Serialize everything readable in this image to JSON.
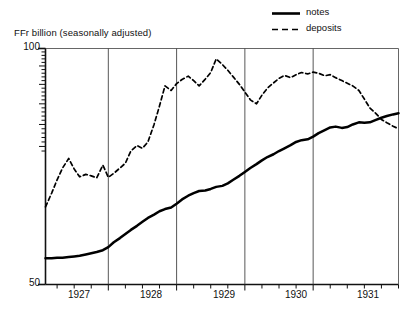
{
  "chart_data": {
    "type": "line",
    "title": "",
    "ylabel": "FFr billion (seasonally adjusted)",
    "xlabel": "",
    "yscale": "log",
    "ylim": [
      50,
      100
    ],
    "ytick_labels": [
      "100",
      "50"
    ],
    "ytick_values": [
      100,
      50
    ],
    "xlim": [
      1926.58,
      1931.75
    ],
    "xtick_labels": [
      "1927",
      "1928",
      "1929",
      "1930",
      "1931"
    ],
    "xtick_values": [
      1927,
      1928,
      1929,
      1930,
      1931
    ],
    "gridlines_x": [
      1927.5,
      1928.5,
      1929.5,
      1930.5
    ],
    "grid": "vertical year boundaries only",
    "legend_position": "top-right",
    "minor_ticks_y": "dense minor ticks on upper portion of left axis (log scale)",
    "minor_ticks_x": "quarterly ticks along bottom axis",
    "series": [
      {
        "name": "notes",
        "style": "solid",
        "color": "#000000",
        "x": [
          1926.58,
          1926.67,
          1926.75,
          1926.83,
          1926.92,
          1927.0,
          1927.08,
          1927.17,
          1927.25,
          1927.33,
          1927.42,
          1927.5,
          1927.58,
          1927.67,
          1927.75,
          1927.83,
          1927.92,
          1928.0,
          1928.08,
          1928.17,
          1928.25,
          1928.33,
          1928.42,
          1928.5,
          1928.58,
          1928.67,
          1928.75,
          1928.83,
          1928.92,
          1929.0,
          1929.08,
          1929.17,
          1929.25,
          1929.33,
          1929.42,
          1929.5,
          1929.58,
          1929.67,
          1929.75,
          1929.83,
          1929.92,
          1930.0,
          1930.08,
          1930.17,
          1930.25,
          1930.33,
          1930.42,
          1930.5,
          1930.58,
          1930.67,
          1930.75,
          1930.83,
          1930.92,
          1931.0,
          1931.08,
          1931.17,
          1931.25,
          1931.33,
          1931.42,
          1931.5,
          1931.58,
          1931.67,
          1931.75
        ],
        "y": [
          54.0,
          54.0,
          54.1,
          54.1,
          54.2,
          54.3,
          54.4,
          54.6,
          54.8,
          55.0,
          55.3,
          55.8,
          56.6,
          57.3,
          58.0,
          58.7,
          59.4,
          60.1,
          60.8,
          61.4,
          62.0,
          62.4,
          62.7,
          63.4,
          64.2,
          64.9,
          65.4,
          65.8,
          65.9,
          66.2,
          66.6,
          66.8,
          67.3,
          68.0,
          68.8,
          69.6,
          70.4,
          71.2,
          72.0,
          72.7,
          73.3,
          74.0,
          74.6,
          75.3,
          76.0,
          76.4,
          76.6,
          77.2,
          78.0,
          78.7,
          79.3,
          79.5,
          79.2,
          79.4,
          80.0,
          80.5,
          80.4,
          80.5,
          81.1,
          81.6,
          82.0,
          82.4,
          82.7
        ]
      },
      {
        "name": "deposits",
        "style": "dashed",
        "color": "#000000",
        "x": [
          1926.58,
          1926.67,
          1926.75,
          1926.83,
          1926.92,
          1927.0,
          1927.08,
          1927.17,
          1927.25,
          1927.33,
          1927.42,
          1927.5,
          1927.58,
          1927.67,
          1927.75,
          1927.83,
          1927.92,
          1928.0,
          1928.08,
          1928.17,
          1928.25,
          1928.33,
          1928.42,
          1928.5,
          1928.58,
          1928.67,
          1928.75,
          1928.83,
          1928.92,
          1929.0,
          1929.08,
          1929.17,
          1929.25,
          1929.33,
          1929.42,
          1929.5,
          1929.58,
          1929.67,
          1929.75,
          1929.83,
          1929.92,
          1930.0,
          1930.08,
          1930.17,
          1930.25,
          1930.33,
          1930.42,
          1930.5,
          1930.58,
          1930.67,
          1930.75,
          1930.83,
          1930.92,
          1931.0,
          1931.08,
          1931.17,
          1931.25,
          1931.33,
          1931.42,
          1931.5,
          1931.58,
          1931.67,
          1931.75
        ],
        "y": [
          62.8,
          65.4,
          68.0,
          70.4,
          72.4,
          70.2,
          68.6,
          69.1,
          68.8,
          68.4,
          71.0,
          68.5,
          69.3,
          70.4,
          71.4,
          74.0,
          75.2,
          74.6,
          76.0,
          80.0,
          84.5,
          89.6,
          88.4,
          90.2,
          91.3,
          92.2,
          91.0,
          89.6,
          91.4,
          93.2,
          97.0,
          95.4,
          93.8,
          92.0,
          90.0,
          88.0,
          86.0,
          85.0,
          87.2,
          89.0,
          90.4,
          91.6,
          92.4,
          91.8,
          92.6,
          93.2,
          92.8,
          93.3,
          93.0,
          92.3,
          92.6,
          91.8,
          91.0,
          90.3,
          89.6,
          88.4,
          86.2,
          84.0,
          82.6,
          81.2,
          80.4,
          79.6,
          79.0
        ]
      }
    ]
  },
  "legend": {
    "items": [
      {
        "label": "notes",
        "style": "solid"
      },
      {
        "label": "deposits",
        "style": "dashed"
      }
    ]
  }
}
